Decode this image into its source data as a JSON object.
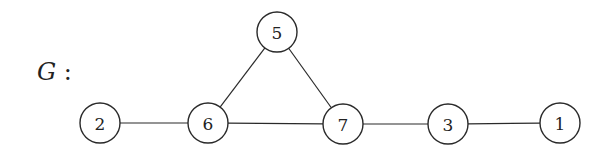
{
  "graph_label": {
    "name": "G",
    "suffix": " :"
  },
  "node_radius": 20,
  "nodes": [
    {
      "id": "5",
      "x": 277,
      "y": 32
    },
    {
      "id": "2",
      "x": 100,
      "y": 123
    },
    {
      "id": "6",
      "x": 208,
      "y": 123
    },
    {
      "id": "7",
      "x": 343,
      "y": 124
    },
    {
      "id": "3",
      "x": 448,
      "y": 124
    },
    {
      "id": "1",
      "x": 560,
      "y": 123
    }
  ],
  "edges": [
    [
      "5",
      "6"
    ],
    [
      "5",
      "7"
    ],
    [
      "2",
      "6"
    ],
    [
      "6",
      "7"
    ],
    [
      "7",
      "3"
    ],
    [
      "3",
      "1"
    ]
  ]
}
